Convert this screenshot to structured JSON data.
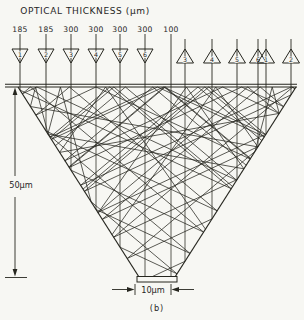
{
  "figure": {
    "title": "OPTICAL THICKNESS (μm)",
    "caption": "(b)",
    "depth_label": "50μm",
    "exit_width_label": "10μm"
  },
  "inputs": {
    "thickness_values": [
      "185",
      "185",
      "300",
      "300",
      "300",
      "300",
      "100"
    ],
    "left_triangle_numbers": [
      "1",
      "2",
      "3",
      "4",
      "5",
      "6"
    ],
    "right_triangle_numbers": [
      "3",
      "4",
      "5",
      "6",
      "1",
      "2"
    ]
  },
  "colors": {
    "ink": "#26261f",
    "paper": "#f7f7f3"
  }
}
